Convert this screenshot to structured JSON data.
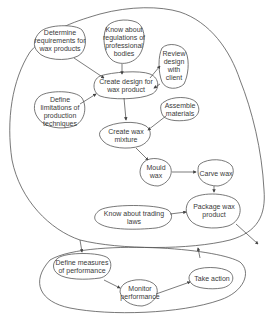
{
  "diagram": {
    "type": "process-flow",
    "groups": [
      {
        "id": "production",
        "label": ""
      },
      {
        "id": "performance",
        "label": ""
      }
    ],
    "nodes": [
      {
        "id": "determine",
        "lines": [
          "Determine",
          "requirements for",
          "wax products"
        ]
      },
      {
        "id": "regulations",
        "lines": [
          "Know about",
          "regulations of",
          "professional",
          "bodies"
        ]
      },
      {
        "id": "review",
        "lines": [
          "Review",
          "design",
          "with",
          "client"
        ]
      },
      {
        "id": "create_design",
        "lines": [
          "Create design for",
          "wax product"
        ]
      },
      {
        "id": "limitations",
        "lines": [
          "Define",
          "limitations of",
          "production",
          "techniques"
        ]
      },
      {
        "id": "assemble",
        "lines": [
          "Assemble",
          "materials"
        ]
      },
      {
        "id": "mixture",
        "lines": [
          "Create wax",
          "mixture"
        ]
      },
      {
        "id": "mould",
        "lines": [
          "Mould",
          "wax"
        ]
      },
      {
        "id": "carve",
        "lines": [
          "Carve wax"
        ]
      },
      {
        "id": "package",
        "lines": [
          "Package wax",
          "product"
        ]
      },
      {
        "id": "trading",
        "lines": [
          "Know about trading",
          "laws"
        ]
      },
      {
        "id": "measures",
        "lines": [
          "Define measures",
          "of performance"
        ]
      },
      {
        "id": "monitor",
        "lines": [
          "Monitor",
          "performance"
        ]
      },
      {
        "id": "action",
        "lines": [
          "Take action"
        ]
      }
    ],
    "edges": [
      [
        "determine",
        "create_design"
      ],
      [
        "regulations",
        "create_design"
      ],
      [
        "create_design",
        "review"
      ],
      [
        "review",
        "create_design"
      ],
      [
        "limitations",
        "create_design"
      ],
      [
        "create_design",
        "mixture"
      ],
      [
        "assemble",
        "mixture"
      ],
      [
        "mixture",
        "mould"
      ],
      [
        "mould",
        "carve"
      ],
      [
        "carve",
        "package"
      ],
      [
        "trading",
        "package"
      ],
      [
        "package",
        "outside"
      ],
      [
        "production",
        "performance"
      ],
      [
        "measures",
        "monitor"
      ],
      [
        "monitor",
        "action"
      ],
      [
        "performance",
        "production"
      ]
    ]
  }
}
